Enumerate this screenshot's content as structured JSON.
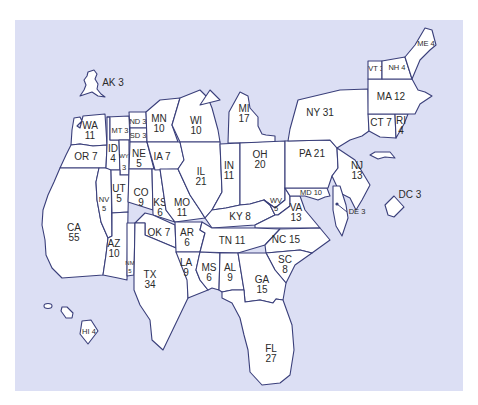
{
  "map": {
    "background_color": "#dcdff4",
    "state_fill": "#ffffff",
    "border_color": "#3a3f7a",
    "label_color": "#2a2a2a"
  },
  "states": {
    "AK": {
      "abbr": "AK",
      "value": "3",
      "label": "AK 3"
    },
    "HI": {
      "abbr": "HI",
      "value": "4",
      "label": "HI 4"
    },
    "WA": {
      "abbr": "WA",
      "value": "11"
    },
    "OR": {
      "abbr": "OR",
      "value": "7",
      "label": "OR 7"
    },
    "CA": {
      "abbr": "CA",
      "value": "55"
    },
    "NV": {
      "abbr": "NV",
      "value": "5"
    },
    "ID": {
      "abbr": "ID",
      "value": "4"
    },
    "MT": {
      "abbr": "MT",
      "value": "3",
      "label": "MT 3"
    },
    "WY": {
      "abbr": "WY",
      "value": "3"
    },
    "UT": {
      "abbr": "UT",
      "value": "5"
    },
    "AZ": {
      "abbr": "AZ",
      "value": "10"
    },
    "CO": {
      "abbr": "CO",
      "value": "9"
    },
    "NM": {
      "abbr": "NM",
      "value": "5"
    },
    "ND": {
      "abbr": "ND",
      "value": "3",
      "label": "ND 3"
    },
    "SD": {
      "abbr": "SD",
      "value": "3",
      "label": "SD 3"
    },
    "NE": {
      "abbr": "NE",
      "value": "5"
    },
    "KS": {
      "abbr": "KS",
      "value": "6"
    },
    "OK": {
      "abbr": "OK",
      "value": "7",
      "label": "OK 7"
    },
    "TX": {
      "abbr": "TX",
      "value": "34"
    },
    "MN": {
      "abbr": "MN",
      "value": "10"
    },
    "IA": {
      "abbr": "IA",
      "value": "7",
      "label": "IA 7"
    },
    "MO": {
      "abbr": "MO",
      "value": "11"
    },
    "AR": {
      "abbr": "AR",
      "value": "6"
    },
    "LA": {
      "abbr": "LA",
      "value": "9"
    },
    "WI": {
      "abbr": "WI",
      "value": "10"
    },
    "IL": {
      "abbr": "IL",
      "value": "21"
    },
    "MI": {
      "abbr": "MI",
      "value": "17"
    },
    "IN": {
      "abbr": "IN",
      "value": "11"
    },
    "OH": {
      "abbr": "OH",
      "value": "20"
    },
    "KY": {
      "abbr": "KY",
      "value": "8",
      "label": "KY 8"
    },
    "TN": {
      "abbr": "TN",
      "value": "11",
      "label": "TN 11"
    },
    "MS": {
      "abbr": "MS",
      "value": "6"
    },
    "AL": {
      "abbr": "AL",
      "value": "9"
    },
    "GA": {
      "abbr": "GA",
      "value": "15"
    },
    "FL": {
      "abbr": "FL",
      "value": "27"
    },
    "SC": {
      "abbr": "SC",
      "value": "8"
    },
    "NC": {
      "abbr": "NC",
      "value": "15",
      "label": "NC 15"
    },
    "VA": {
      "abbr": "VA",
      "value": "13"
    },
    "WV": {
      "abbr": "WV",
      "value": "5"
    },
    "MD": {
      "abbr": "MD",
      "value": "10",
      "label": "MD 10"
    },
    "DE": {
      "abbr": "DE",
      "value": "3",
      "label": "DE 3"
    },
    "DC": {
      "abbr": "DC",
      "value": "3",
      "label": "DC 3"
    },
    "PA": {
      "abbr": "PA",
      "value": "21",
      "label": "PA 21"
    },
    "NJ": {
      "abbr": "NJ",
      "value": "13"
    },
    "NY": {
      "abbr": "NY",
      "value": "31",
      "label": "NY 31"
    },
    "CT": {
      "abbr": "CT",
      "value": "7",
      "label": "CT 7"
    },
    "RI": {
      "abbr": "RI",
      "value": "4"
    },
    "MA": {
      "abbr": "MA",
      "value": "12",
      "label": "MA 12"
    },
    "VT": {
      "abbr": "VT",
      "value": "3",
      "label": "VT 3"
    },
    "NH": {
      "abbr": "NH",
      "value": "4",
      "label": "NH 4"
    },
    "ME": {
      "abbr": "ME",
      "value": "4",
      "label": "ME 4"
    }
  }
}
